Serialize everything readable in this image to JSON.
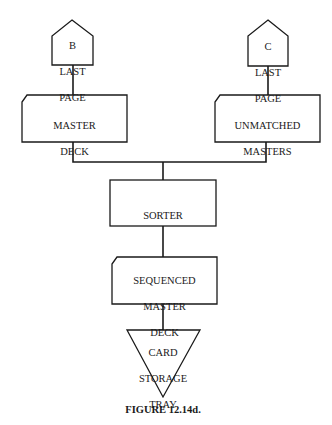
{
  "diagram": {
    "nodes": {
      "b_last_page": {
        "line1": "B",
        "line2": "LAST",
        "line3": "PAGE",
        "shape": "off-page-connector"
      },
      "master_deck": {
        "line1": "MASTER",
        "line2": "DECK",
        "shape": "punched-card"
      },
      "c_last_page": {
        "line1": "C",
        "line2": "LAST",
        "line3": "PAGE",
        "shape": "off-page-connector"
      },
      "unmatched_masters": {
        "line1": "UNMATCHED",
        "line2": "MASTERS",
        "shape": "punched-card"
      },
      "sorter": {
        "label": "SORTER",
        "shape": "process"
      },
      "sequenced_master_deck": {
        "line1": "SEQUENCED",
        "line2": "MASTER",
        "line3": "DECK",
        "shape": "punched-card"
      },
      "card_storage_tray": {
        "line1": "CARD",
        "line2": "STORAGE",
        "line3": "TRAY",
        "shape": "offline-storage"
      }
    },
    "edges": [
      {
        "from": "b_last_page",
        "to": "master_deck"
      },
      {
        "from": "c_last_page",
        "to": "unmatched_masters"
      },
      {
        "from": "master_deck",
        "to": "sorter"
      },
      {
        "from": "unmatched_masters",
        "to": "sorter"
      },
      {
        "from": "sorter",
        "to": "sequenced_master_deck"
      },
      {
        "from": "sequenced_master_deck",
        "to": "card_storage_tray"
      }
    ],
    "caption": "FIGURE 12.14d.",
    "colors": {
      "stroke": "#1a1a1a",
      "background": "#ffffff"
    }
  }
}
